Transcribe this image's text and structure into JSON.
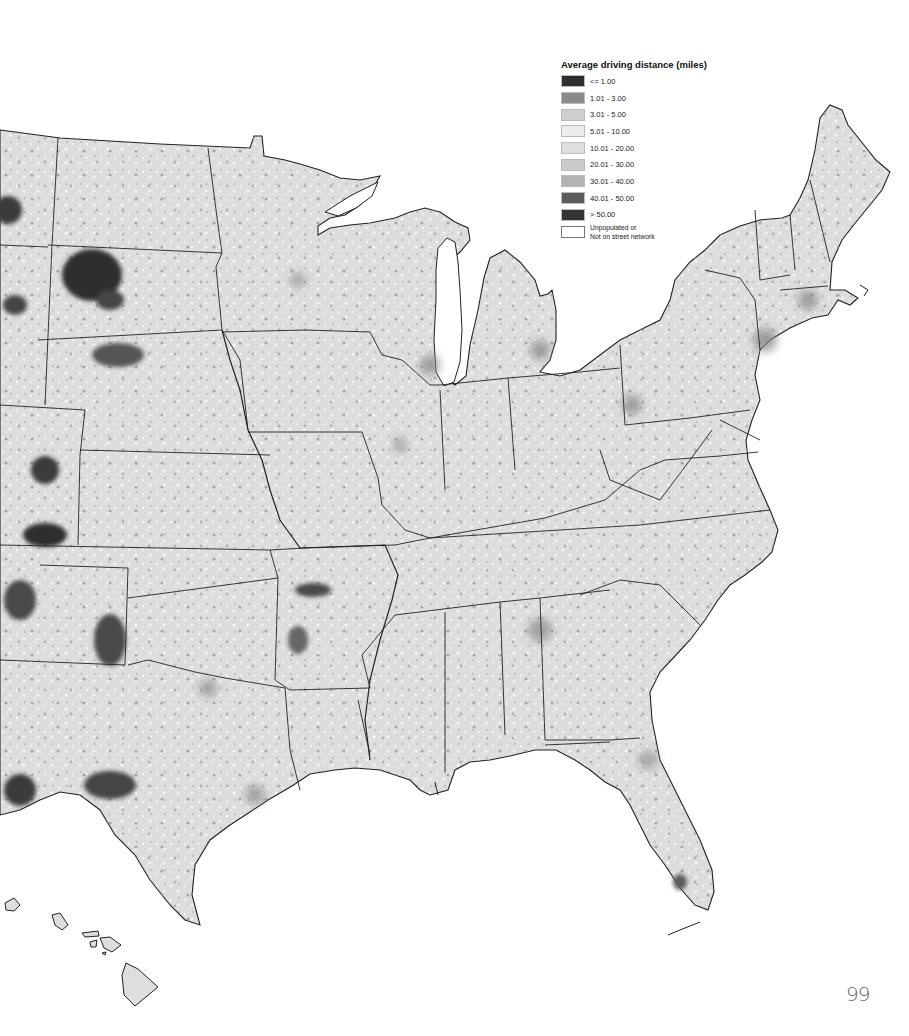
{
  "figure": {
    "type": "choropleth map",
    "region": "Contiguous United States (central and eastern), plus Hawaii inset"
  },
  "legend": {
    "title": "Average driving distance (miles)",
    "items": [
      {
        "label": "<= 1.00",
        "color": "#2e2e2e"
      },
      {
        "label": "1.01 - 3.00",
        "color": "#8a8a8a"
      },
      {
        "label": "3.01 - 5.00",
        "color": "#cfcfcf"
      },
      {
        "label": "5.01 - 10.00",
        "color": "#ececec"
      },
      {
        "label": "10.01 - 20.00",
        "color": "#dedede"
      },
      {
        "label": "20.01 - 30.00",
        "color": "#cbcbcb"
      },
      {
        "label": "30.01 - 40.00",
        "color": "#b3b3b3"
      },
      {
        "label": "40.01 - 50.00",
        "color": "#5c5c5c"
      },
      {
        "label": "> 50.00",
        "color": "#333333"
      },
      {
        "label": "Unpopulated or\nNot on street network",
        "color": "#ffffff"
      }
    ]
  },
  "page": {
    "number": "99"
  },
  "colors": {
    "background": "#ffffff",
    "land_base": "#dcdcdc",
    "state_border": "#222222"
  }
}
